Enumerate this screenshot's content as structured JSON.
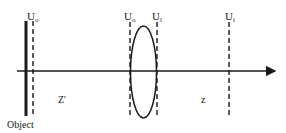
{
  "diagram": {
    "labels": {
      "object": "Object",
      "u_object_plane": "U",
      "u_object_plane_sub": "o",
      "u_lens_front": "U",
      "u_lens_front_sub": "o",
      "u_lens_back": "U",
      "u_lens_back_sub": "l",
      "u_image_plane": "U",
      "u_image_plane_sub": "i",
      "distance_object_to_lens": "Z'",
      "distance_lens_to_image": "z"
    },
    "colors": {
      "stroke": "#1a1a1a",
      "background": "#ffffff"
    }
  }
}
